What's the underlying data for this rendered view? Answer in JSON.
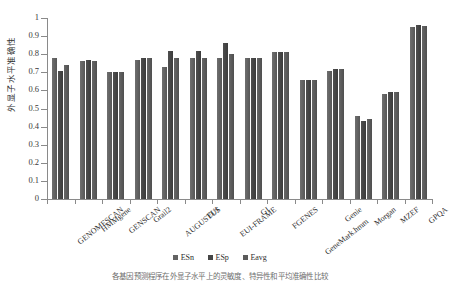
{
  "chart_data": {
    "type": "bar",
    "title": "",
    "xlabel": "",
    "ylabel": "外显子水平准确性",
    "ylim": [
      0,
      1
    ],
    "ytick_labels": [
      "1",
      "0.9",
      "0.8",
      "0.7",
      "0.6",
      "0.5",
      "0.4",
      "0.3",
      "0.2",
      "0.1",
      "0"
    ],
    "ytick_values": [
      1,
      0.9,
      0.8,
      0.7,
      0.6,
      0.5,
      0.4,
      0.3,
      0.2,
      0.1,
      0
    ],
    "grid": false,
    "legend_position": "bottom-center",
    "categories": [
      "GENOMESCAN",
      "HMMgene",
      "GENSCAN",
      "Grail2",
      "AUGUSTUS",
      "EUI",
      "EUI-FRAME",
      "GI",
      "FGENES",
      "GeneMark.hmm",
      "Genie",
      "Morgan",
      "MZEF",
      "GPQA"
    ],
    "series": [
      {
        "name": "ESn",
        "values": [
          0.78,
          0.76,
          0.7,
          0.77,
          0.73,
          0.78,
          0.78,
          0.78,
          0.81,
          0.66,
          0.71,
          0.46,
          0.58,
          0.95
        ]
      },
      {
        "name": "ESp",
        "values": [
          0.71,
          0.77,
          0.7,
          0.78,
          0.82,
          0.82,
          0.86,
          0.78,
          0.81,
          0.66,
          0.72,
          0.43,
          0.59,
          0.96
        ]
      },
      {
        "name": "Eavg",
        "values": [
          0.74,
          0.76,
          0.7,
          0.78,
          0.78,
          0.78,
          0.8,
          0.78,
          0.81,
          0.66,
          0.72,
          0.44,
          0.59,
          0.955
        ]
      }
    ]
  },
  "legend": {
    "items": [
      {
        "label": "ESn",
        "color": "#636363"
      },
      {
        "label": "ESp",
        "color": "#454545"
      },
      {
        "label": "Eavg",
        "color": "#5b5b5b"
      }
    ]
  },
  "caption": {
    "text": "各基因预测程序在外显子水平上的灵敏度、特异性和平均准确性比较"
  }
}
